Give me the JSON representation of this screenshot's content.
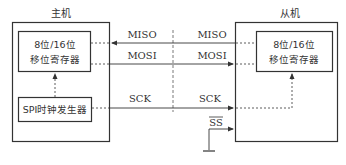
{
  "master": {
    "title": "主机",
    "shift_register": {
      "line1": "8位/16位",
      "line2": "移位寄存器"
    },
    "clock_generator": "SPI时钟发生器"
  },
  "slave": {
    "title": "从机",
    "shift_register": {
      "line1": "8位/16位",
      "line2": "移位寄存器"
    }
  },
  "signals": {
    "miso": {
      "left_label": "MISO",
      "right_label": "MISO",
      "direction": "slave-to-master"
    },
    "mosi": {
      "left_label": "MOSI",
      "right_label": "MOSI",
      "direction": "master-to-slave"
    },
    "sck": {
      "left_label": "SCK",
      "right_label": "SCK",
      "direction": "master-to-slave"
    },
    "ss": {
      "label": "SS",
      "overline": true,
      "connected_to": "ground"
    }
  },
  "colors": {
    "line": "#333333",
    "background": "#ffffff"
  }
}
